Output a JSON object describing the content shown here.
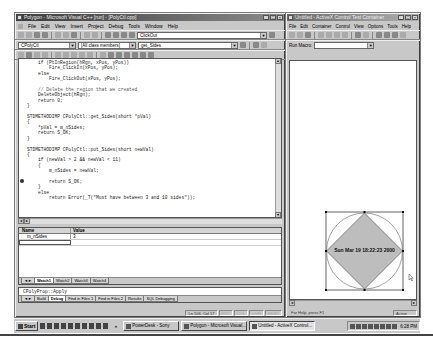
{
  "left_window": {
    "title": "Polygon - Microsoft Visual C++ [run] - [PolyCtl.cpp]",
    "title_buttons": [
      "_",
      "□",
      "×"
    ],
    "menu": [
      "File",
      "Edit",
      "View",
      "Insert",
      "Project",
      "Debug",
      "Tools",
      "Window",
      "Help"
    ],
    "toolbar_find_value": "ClickOut",
    "class_combo": "CPolyCtl",
    "members_combo": "[All class members]",
    "function_combo": "get_Sides",
    "code_lines": [
      "    if (PtInRegion(hRgn, xPos, yPos))",
      "        Fire_ClickIn(xPos, yPos);",
      "    else",
      "        Fire_ClickOut(xPos, yPos);",
      "",
      "    // Delete the region that we created",
      "    DeleteObject(hRgn);",
      "    return 0;",
      "}",
      "",
      "STDMETHODIMP CPolyCtl::get_Sides(short *pVal)",
      "{",
      "    *pVal = m_nSides;",
      "    return S_OK;",
      "}",
      "",
      "STDMETHODIMP CPolyCtl::put_Sides(short newVal)",
      "{",
      "    if (newVal > 2 && newVal < 11)",
      "    {",
      "        m_nSides = newVal;",
      "",
      "        return S_OK;",
      "    }",
      "    else",
      "        return Error(_T(\"Must have between 3 and 10 sides\"));"
    ],
    "breakpoint_line": 22,
    "watch": {
      "columns": [
        "Name",
        "Value"
      ],
      "rows": [
        {
          "name": "m_nSides",
          "value": "3"
        }
      ],
      "tabs": [
        "Watch1",
        "Watch2",
        "Watch3",
        "Watch4"
      ],
      "active_tab": "Watch1"
    },
    "output": {
      "text": "CPolyProp::Apply",
      "tabs": [
        "Build",
        "Debug",
        "Find in Files 1",
        "Find in Files 2",
        "Results",
        "SQL Debugging"
      ],
      "active_tab": "Debug"
    },
    "status": {
      "position": "Ln 106, Col 17",
      "indicators": [
        "REC",
        "COL",
        "OVR",
        "READ"
      ]
    }
  },
  "right_window": {
    "title": "Untitled - ActiveX Control Test Container",
    "title_buttons": [
      "_",
      "□",
      "×"
    ],
    "menu": [
      "File",
      "Edit",
      "Container",
      "Control",
      "View",
      "Options",
      "Tools",
      "Help"
    ],
    "run_macro_label": "Run Macro:",
    "run_macro_value": "",
    "control_caption": "Sun Mar 19 18:22:23 2000",
    "status_help": "For Help, press F1",
    "status_mode": "Active",
    "polygon_fill": "#bdbdbd"
  },
  "taskbar": {
    "start_label": "Start",
    "tasks": [
      {
        "label": "PowerDesk - Sony",
        "active": false
      },
      {
        "label": "Polygon - Microsoft Visual...",
        "active": false
      },
      {
        "label": "Untitled - ActiveX Control...",
        "active": true
      }
    ],
    "clock": "6:28 PM"
  }
}
